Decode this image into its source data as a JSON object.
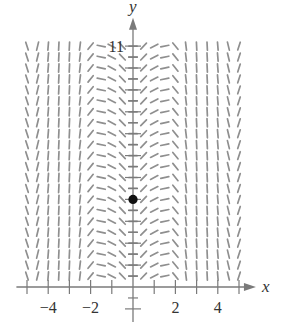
{
  "figure": {
    "colors": {
      "segment": "#8f8f8f",
      "axis": "#7a7a7a",
      "point": "#111111",
      "text": "#333333"
    },
    "x_axis": {
      "label": "x",
      "range": [
        -5.5,
        5.8
      ],
      "tick_step": 0.5,
      "tick_labels": [
        {
          "value": -4,
          "text": "−4"
        },
        {
          "value": -2,
          "text": "−2"
        },
        {
          "value": 2,
          "text": "2"
        },
        {
          "value": 4,
          "text": "4"
        }
      ]
    },
    "y_axis": {
      "label": "y",
      "range": [
        -1.6,
        12.3
      ],
      "tick_step": 0.5,
      "tick_labels": [
        {
          "value": 11,
          "text": "11"
        }
      ]
    },
    "slope_field": {
      "x_values": [
        -5,
        -4.5,
        -4,
        -3.5,
        -3,
        -2.5,
        -2,
        -1.5,
        -1,
        -0.5,
        0,
        0.5,
        1,
        1.5,
        2,
        2.5,
        3,
        3.5,
        4,
        4.5,
        5
      ],
      "slopes": [
        -3,
        4,
        12,
        20,
        20,
        8,
        1.2,
        -0.2,
        -0.5,
        -1,
        0,
        1,
        0.5,
        0.2,
        -1.2,
        -8,
        -20,
        -20,
        -12,
        -4,
        3
      ],
      "y_start": 0.5,
      "y_end": 11,
      "y_step": 0.5,
      "depends_only_on_x": true
    },
    "point": {
      "x": 0,
      "y": 4
    }
  }
}
